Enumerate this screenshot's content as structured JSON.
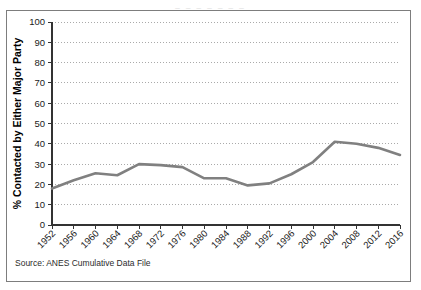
{
  "top_clipped_text": "_  _   _   _    _   _  _",
  "source_note": "Source: ANES Cumulative Data File",
  "chart_data": {
    "type": "line",
    "title": "",
    "xlabel": "",
    "ylabel": "% Contacted by Either Major Party",
    "ylim": [
      0,
      100
    ],
    "ytick_step": 10,
    "yticks": [
      "0",
      "10",
      "20",
      "30",
      "40",
      "50",
      "60",
      "70",
      "80",
      "90",
      "100"
    ],
    "grid": true,
    "grid_style": "dotted-horizontal",
    "legend": "none",
    "line_color": "#808080",
    "line_width": 2.6,
    "markers": "none",
    "categories": [
      "1952",
      "1956",
      "1960",
      "1964",
      "1968",
      "1972",
      "1976",
      "1980",
      "1984",
      "1988",
      "1992",
      "1996",
      "2000",
      "2004",
      "2008",
      "2012",
      "2016"
    ],
    "values": [
      18,
      22,
      25.5,
      24.5,
      30,
      29.5,
      28.5,
      23,
      23,
      19.5,
      20.5,
      25,
      31,
      41,
      40,
      38,
      34.5
    ],
    "series": [
      {
        "name": "% Contacted by Either Major Party",
        "values": [
          18,
          22,
          25.5,
          24.5,
          30,
          29.5,
          28.5,
          23,
          23,
          19.5,
          20.5,
          25,
          31,
          41,
          40,
          38,
          34.5
        ]
      }
    ]
  }
}
